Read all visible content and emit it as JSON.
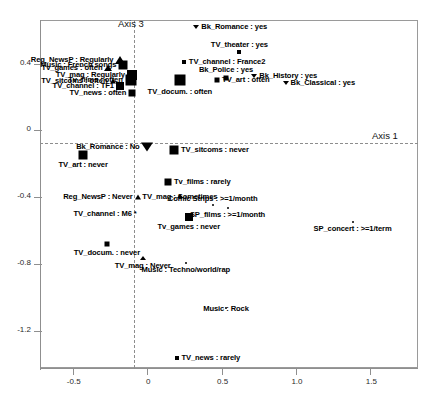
{
  "chart_data": {
    "type": "scatter",
    "title": "",
    "xlabel": "Axis 1",
    "ylabel": "Axis 3",
    "xlim": [
      -0.72,
      1.82
    ],
    "ylim": [
      -1.42,
      0.66
    ],
    "xticks": [
      "-0.5",
      "0",
      "0.5",
      "1.0",
      "1.5"
    ],
    "xtick_values": [
      -0.5,
      0,
      0.5,
      1.0,
      1.5
    ],
    "yticks": [
      "0.4",
      "0",
      "-0.4",
      "-0.8",
      "-1.2"
    ],
    "ytick_values": [
      0.4,
      0,
      -0.4,
      -0.8,
      -1.2
    ],
    "grid": false,
    "legend": "none",
    "reference_lines": {
      "vertical_at_x": 0,
      "horizontal_at_y": 0,
      "style": "dashed"
    },
    "points": [
      {
        "label": "Bk_Romance : yes",
        "x": 0.33,
        "y": 0.62,
        "marker": "triangle-down",
        "size": 5,
        "label_pos": "right"
      },
      {
        "label": "TV_theater : yes",
        "x": 0.62,
        "y": 0.47,
        "marker": "square",
        "size": 4,
        "label_pos": "above"
      },
      {
        "label": "TV_channel : France2",
        "x": 0.25,
        "y": 0.41,
        "marker": "square",
        "size": 4,
        "label_pos": "right"
      },
      {
        "label": "Reg_NewsP : Regularly",
        "x": -0.18,
        "y": 0.42,
        "marker": "triangle-up",
        "size": 9,
        "label_pos": "left"
      },
      {
        "label": "Music : French songs",
        "x": -0.16,
        "y": 0.39,
        "marker": "square",
        "size": 9,
        "label_pos": "left"
      },
      {
        "label": "Tv_games : often",
        "x": -0.26,
        "y": 0.375,
        "marker": "triangle-up",
        "size": 7,
        "label_pos": "left"
      },
      {
        "label": "TV_mag : Regularly",
        "x": -0.1,
        "y": 0.33,
        "marker": "square",
        "size": 10,
        "label_pos": "left"
      },
      {
        "label": "Tv_films : often",
        "x": -0.11,
        "y": 0.3,
        "marker": "square",
        "size": 11,
        "label_pos": "left"
      },
      {
        "label": "TV_sitcoms : often",
        "x": -0.23,
        "y": 0.295,
        "marker": "triangle-up",
        "size": 6,
        "label_pos": "left"
      },
      {
        "label": "TV_channel : TF1",
        "x": -0.18,
        "y": 0.265,
        "marker": "square",
        "size": 8,
        "label_pos": "left"
      },
      {
        "label": "TV_news : often",
        "x": -0.1,
        "y": 0.225,
        "marker": "square",
        "size": 7,
        "label_pos": "left"
      },
      {
        "label": "TV_docum. : often",
        "x": 0.22,
        "y": 0.3,
        "marker": "square",
        "size": 11,
        "label_pos": "below"
      },
      {
        "label": "TV_art : often",
        "x": 0.47,
        "y": 0.3,
        "marker": "square",
        "size": 5,
        "label_pos": "right"
      },
      {
        "label": "Bk_Police : yes",
        "x": 0.53,
        "y": 0.315,
        "marker": "square",
        "size": 5,
        "label_pos": "above"
      },
      {
        "label": "Bk_History : yes",
        "x": 0.72,
        "y": 0.325,
        "marker": "triangle-down",
        "size": 5,
        "label_pos": "right"
      },
      {
        "label": "Bk_Classical : yes",
        "x": 0.93,
        "y": 0.285,
        "marker": "triangle-down",
        "size": 5,
        "label_pos": "right"
      },
      {
        "label": "Bk_Romance : No",
        "x": 0.0,
        "y": -0.1,
        "marker": "triangle-down",
        "size": 10,
        "label_pos": "left"
      },
      {
        "label": "TV_sitcoms : never",
        "x": 0.18,
        "y": -0.115,
        "marker": "square",
        "size": 9,
        "label_pos": "right"
      },
      {
        "label": "TV_art : never",
        "x": -0.43,
        "y": -0.145,
        "marker": "square",
        "size": 9,
        "label_pos": "below"
      },
      {
        "label": "Tv_films : rarely",
        "x": 0.14,
        "y": -0.31,
        "marker": "square",
        "size": 7,
        "label_pos": "right"
      },
      {
        "label": "Reg_NewsP : Never",
        "x": -0.06,
        "y": -0.4,
        "marker": "triangle-up",
        "size": 6,
        "label_pos": "left"
      },
      {
        "label": "TV_mag : Sometimes",
        "x": 0.22,
        "y": -0.39,
        "marker": "triangle-up",
        "size": 5,
        "label_pos": "split"
      },
      {
        "label": "Comic Strips : >=1/month",
        "x": 0.44,
        "y": -0.445,
        "marker": "dot",
        "size": 2,
        "label_pos": "above"
      },
      {
        "label": "SP_films : >=1/month",
        "x": 0.54,
        "y": -0.465,
        "marker": "dot",
        "size": 2,
        "label_pos": "below"
      },
      {
        "label": "TV_channel : M6 *",
        "x": -0.04,
        "y": -0.5,
        "marker": "none",
        "size": 0,
        "label_pos": "left"
      },
      {
        "label": "Tv_games : never",
        "x": 0.28,
        "y": -0.52,
        "marker": "square",
        "size": 8,
        "label_pos": "below"
      },
      {
        "label": "SP_concert : >=1/term",
        "x": 1.38,
        "y": -0.55,
        "marker": "dot",
        "size": 2,
        "label_pos": "below"
      },
      {
        "label": "TV_docum. : never",
        "x": -0.27,
        "y": -0.68,
        "marker": "square",
        "size": 5,
        "label_pos": "below"
      },
      {
        "label": "TV_mag : Never",
        "x": -0.03,
        "y": -0.76,
        "marker": "triangle-up",
        "size": 5,
        "label_pos": "below"
      },
      {
        "label": "Music : Techno/world/rap",
        "x": 0.26,
        "y": -0.79,
        "marker": "dot",
        "size": 2,
        "label_pos": "below"
      },
      {
        "label": "Music : Rock",
        "x": 0.53,
        "y": -1.06,
        "marker": "dot",
        "size": 2,
        "label_pos": "split"
      },
      {
        "label": "TV_news : rarely",
        "x": 0.2,
        "y": -1.36,
        "marker": "square",
        "size": 4,
        "label_pos": "right"
      }
    ]
  },
  "axes": {
    "x_title": "Axis 1",
    "y_title": "Axis 3"
  },
  "colors": {
    "marker": "#000000",
    "frame": "#9a9a9a",
    "ref_line": "#8d8d8d",
    "background": "#ffffff"
  }
}
